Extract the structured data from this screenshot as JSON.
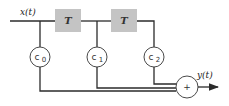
{
  "diagram": {
    "type": "FIR filter (tapped delay line)",
    "input_label": "x(t)",
    "output_label": "y(t)",
    "delays": [
      {
        "label": "T"
      },
      {
        "label": "T"
      }
    ],
    "coefficients": [
      {
        "base": "c",
        "sub": "0"
      },
      {
        "base": "c",
        "sub": "1"
      },
      {
        "base": "c",
        "sub": "2"
      }
    ],
    "summer_label": "+",
    "colors": {
      "delay_fill": "#c4c4c4",
      "line": "#2b2b2b"
    }
  }
}
